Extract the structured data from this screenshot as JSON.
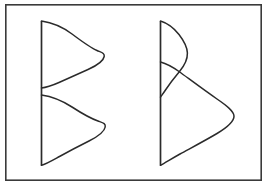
{
  "figure": {
    "background_color": "#ffffff",
    "line_color": "#2b2b2b",
    "frame_color": "#3a3a3a",
    "frame": {
      "x": 5,
      "y": 4,
      "width": 257,
      "height": 177
    }
  },
  "chart_data": {
    "type": "line",
    "title": "",
    "subtitle": "",
    "xlabel": "",
    "ylabel": "",
    "grid": false,
    "legend": null,
    "annotations": [],
    "panels": [
      {
        "name": "left-panel",
        "description": "Two separate bell-shaped density curves stacked vertically along a common axis; the curves do not overlap and meet the axis at distinct points.",
        "axis": {
          "x": 41.5,
          "y_top": 21,
          "y_bottom": 165
        },
        "curves": [
          {
            "name": "left-upper-curve",
            "orientation": "horizontal-density-opening-right",
            "baseline_x": 41.5,
            "start_y": 21,
            "end_y": 88,
            "peak_x": 103,
            "peak_y": 52,
            "amplitude": 61.5,
            "width_y": 67
          },
          {
            "name": "left-lower-curve",
            "orientation": "horizontal-density-opening-right",
            "baseline_x": 41.5,
            "start_y": 95,
            "end_y": 165,
            "peak_x": 104,
            "peak_y": 120,
            "amplitude": 62.5,
            "width_y": 70
          }
        ]
      },
      {
        "name": "right-panel",
        "description": "Two bell-shaped density curves on a common axis that overlap and cross each other in an X pattern; the upper curve is narrow and short, the lower curve is broad and tall.",
        "axis": {
          "x": 160.5,
          "y_top": 21,
          "y_bottom": 165
        },
        "curves": [
          {
            "name": "right-narrow-curve",
            "orientation": "horizontal-density-opening-right",
            "baseline_x": 160.5,
            "start_y": 21,
            "end_y": 97,
            "peak_x": 187,
            "peak_y": 55,
            "amplitude": 26.5,
            "width_y": 76
          },
          {
            "name": "right-broad-curve",
            "orientation": "horizontal-density-opening-right",
            "baseline_x": 160.5,
            "start_y": 62,
            "end_y": 165,
            "peak_x": 233,
            "peak_y": 116,
            "amplitude": 72.5,
            "width_y": 103
          }
        ],
        "crossing_points": [
          {
            "x": 173,
            "y": 70
          }
        ]
      }
    ]
  }
}
